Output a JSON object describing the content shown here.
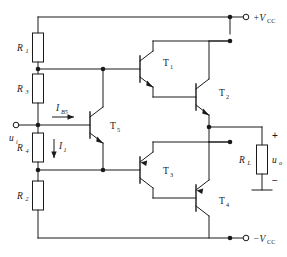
{
  "diagram": {
    "type": "schematic"
  },
  "supplies": {
    "positive": {
      "symbol": "+V",
      "subscript": "CC",
      "terminal": "open-circle"
    },
    "negative": {
      "symbol": "−V",
      "subscript": "CC",
      "terminal": "open-circle"
    }
  },
  "ports": {
    "input": {
      "symbol": "u",
      "subscript": "i",
      "terminal": "open-circle"
    },
    "output": {
      "symbol": "u",
      "subscript": "o",
      "plus": "+",
      "minus": "−"
    }
  },
  "resistors": [
    {
      "id": "R1",
      "symbol": "R",
      "subscript": "1"
    },
    {
      "id": "R3",
      "symbol": "R",
      "subscript": "3"
    },
    {
      "id": "R4",
      "symbol": "R",
      "subscript": "4"
    },
    {
      "id": "R2",
      "symbol": "R",
      "subscript": "2"
    },
    {
      "id": "RL",
      "symbol": "R",
      "subscript": "L"
    }
  ],
  "transistors": [
    {
      "id": "T1",
      "symbol": "T",
      "subscript": "1",
      "polarity": "NPN"
    },
    {
      "id": "T2",
      "symbol": "T",
      "subscript": "2",
      "polarity": "NPN"
    },
    {
      "id": "T3",
      "symbol": "T",
      "subscript": "3",
      "polarity": "PNP"
    },
    {
      "id": "T4",
      "symbol": "T",
      "subscript": "4",
      "polarity": "PNP"
    },
    {
      "id": "T5",
      "symbol": "T",
      "subscript": "5",
      "polarity": "NPN"
    }
  ],
  "currents": [
    {
      "id": "IB5",
      "symbol": "I",
      "subscript": "B5",
      "direction": "right"
    },
    {
      "id": "I1",
      "symbol": "I",
      "subscript": "1",
      "direction": "down"
    }
  ],
  "colors": {
    "ink": "#1a1a1a",
    "paper": "#ffffff"
  }
}
